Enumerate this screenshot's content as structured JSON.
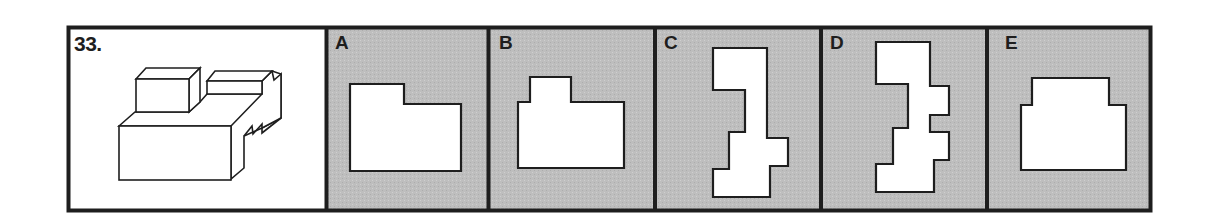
{
  "question": {
    "number_label": "33.",
    "figure": "isometric-block-object"
  },
  "options": [
    {
      "letter": "A",
      "shape": "L-profile-step-right"
    },
    {
      "letter": "B",
      "shape": "profile-raised-tab-left"
    },
    {
      "letter": "C",
      "shape": "tall-stepped-profile-single-right-tab"
    },
    {
      "letter": "D",
      "shape": "tall-stepped-profile-double-right-tabs"
    },
    {
      "letter": "E",
      "shape": "profile-centered-raised-block"
    }
  ],
  "colors": {
    "border": "#1e1e1e",
    "option_background": "#bdbdbd",
    "question_background": "#ffffff",
    "shape_fill": "#ffffff"
  }
}
